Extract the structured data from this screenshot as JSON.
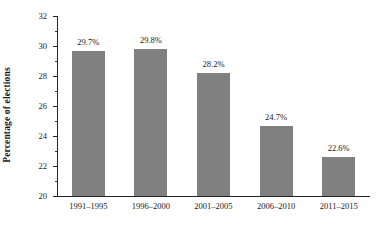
{
  "chart_data": {
    "type": "bar",
    "title": "",
    "subtitle": "",
    "xlabel": "",
    "ylabel": "Percentage of elections",
    "categories": [
      "1991–1995",
      "1996–2000",
      "2001–2005",
      "2006–2010",
      "2011–2015"
    ],
    "values": [
      29.7,
      29.8,
      28.2,
      24.7,
      22.6
    ],
    "value_labels": [
      "29.7%",
      "29.8%",
      "28.2%",
      "24.7%",
      "22.6%"
    ],
    "ylim": [
      20,
      32
    ],
    "ytick_labels": [
      "20",
      "22",
      "24",
      "26",
      "28",
      "30",
      "32"
    ],
    "ytick_values": [
      20,
      22,
      24,
      26,
      28,
      30,
      32
    ],
    "yminor_values": [
      21,
      23,
      25,
      27,
      29,
      31
    ],
    "grid": false,
    "legend": null,
    "bar_color": "#808080",
    "axis_color": "#252525",
    "background_color": "#ffffff"
  }
}
